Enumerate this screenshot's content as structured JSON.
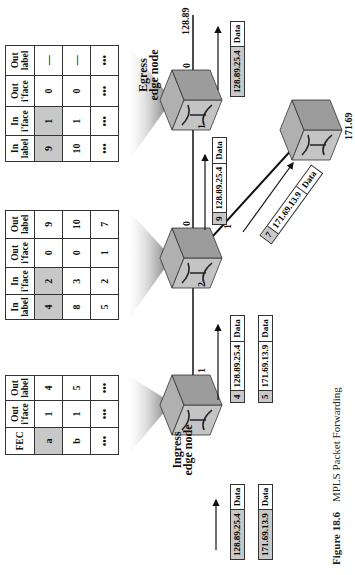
{
  "figure": {
    "number": "Figure 18.6",
    "title": "MPLS Packet Forwarding"
  },
  "ingress_table": {
    "headers": [
      "FEC",
      "Out i'face",
      "Out label"
    ],
    "rows": [
      [
        "a",
        "1",
        "4"
      ],
      [
        "b",
        "1",
        "5"
      ],
      [
        "•••",
        "•••",
        "•••"
      ]
    ],
    "highlighted": [
      [
        0,
        0
      ]
    ]
  },
  "middle_table": {
    "headers": [
      "In label",
      "In i'face",
      "Out i'face",
      "Out label"
    ],
    "rows": [
      [
        "4",
        "2",
        "0",
        "9"
      ],
      [
        "8",
        "3",
        "0",
        "10"
      ],
      [
        "5",
        "2",
        "1",
        "7"
      ]
    ],
    "highlighted": [
      [
        0,
        0
      ],
      [
        0,
        1
      ]
    ]
  },
  "egress_table": {
    "headers": [
      "In label",
      "In i'face",
      "Out i'face",
      "Out label"
    ],
    "rows": [
      [
        "9",
        "1",
        "0",
        "—"
      ],
      [
        "10",
        "1",
        "0",
        "—"
      ],
      [
        "•••",
        "•••",
        "•••",
        "•••"
      ]
    ],
    "highlighted": [
      [
        0,
        0
      ],
      [
        0,
        1
      ]
    ]
  },
  "nodes": {
    "ingress": {
      "label_line1": "Ingress",
      "label_line2": "edge node",
      "port_out": "1"
    },
    "middle": {
      "port_in": "2",
      "port_out_0": "0",
      "port_out_1": "1"
    },
    "egress": {
      "label_line1": "Egress",
      "label_line2": "edge node",
      "port_in": "1",
      "port_out": "0",
      "network": "128.89"
    },
    "branch": {
      "network": "171.69"
    }
  },
  "packets": {
    "ingress_in_1": {
      "addr": "128.89.25.4",
      "data": "Data"
    },
    "ingress_in_2": {
      "addr": "171.69.13.9",
      "data": "Data"
    },
    "hop1_1": {
      "label": "4",
      "addr": "128.89.25.4",
      "data": "Data"
    },
    "hop1_2": {
      "label": "5",
      "addr": "171.69.13.9",
      "data": "Data"
    },
    "hop2_egress": {
      "label": "9",
      "addr": "128.89.25.4",
      "data": "Data"
    },
    "hop2_branch": {
      "label": "7",
      "addr": "171.69.13.9",
      "data": "Data"
    },
    "egress_out": {
      "addr": "128.89.25.4",
      "data": "Data"
    }
  },
  "colors": {
    "highlight": "#c8c8c8",
    "router_top": "#a8a8a8",
    "router_side": "#9a9a9a",
    "router_face": "#c2c2c2"
  }
}
